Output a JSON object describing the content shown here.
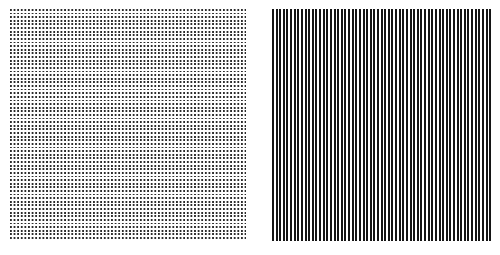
{
  "figure": {
    "title": "",
    "background_color": "#ffffff",
    "width": 500,
    "height": 255,
    "caption": ""
  },
  "panels": [
    {
      "id": "dot-grid",
      "name": "square-dot-grid",
      "pattern_type": "dot-grid",
      "label": "",
      "x": 10,
      "y": 9,
      "width": 236,
      "height": 230,
      "period_px": 3.62,
      "element_size_px": 1.85,
      "foreground_color": "#2b2b2b",
      "background_color": "#ffffff",
      "orientation": "orthogonal"
    },
    {
      "id": "line-grating",
      "name": "vertical-line-grating",
      "pattern_type": "vertical-stripes",
      "label": "",
      "x": 272,
      "y": 9,
      "width": 219,
      "height": 232,
      "period_px": 3.62,
      "element_size_px": 2.0,
      "foreground_color": "#141414",
      "background_color": "#ffffff",
      "orientation": "vertical"
    }
  ]
}
